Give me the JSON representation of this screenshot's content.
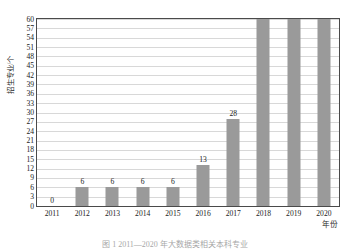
{
  "chart_data": {
    "type": "bar",
    "title": "",
    "xlabel": "年份",
    "ylabel": "招生专业/个",
    "categories": [
      "2011",
      "2012",
      "2013",
      "2014",
      "2015",
      "2016",
      "2017",
      "2018",
      "2019",
      "2020"
    ],
    "values": [
      0,
      6,
      6,
      6,
      6,
      13,
      28,
      60,
      61,
      61
    ],
    "value_labels": [
      "0",
      "6",
      "6",
      "6",
      "6",
      "13",
      "28",
      "60",
      "61",
      "61"
    ],
    "ylim": [
      0,
      60
    ],
    "ytick_step": 3,
    "yticks": [
      "0",
      "3",
      "6",
      "9",
      "12",
      "15",
      "18",
      "21",
      "24",
      "27",
      "30",
      "33",
      "36",
      "39",
      "42",
      "45",
      "48",
      "51",
      "54",
      "57",
      "60"
    ],
    "grid": "horizontal",
    "legend": "none",
    "bar_color": "#9a9a9a",
    "frame_color": "#4a4a4a",
    "gridline_color": "#d8d8d8",
    "background": "#ffffff"
  },
  "caption": {
    "text": "图 1  2011—2020 年大数据类相关本科专业"
  }
}
